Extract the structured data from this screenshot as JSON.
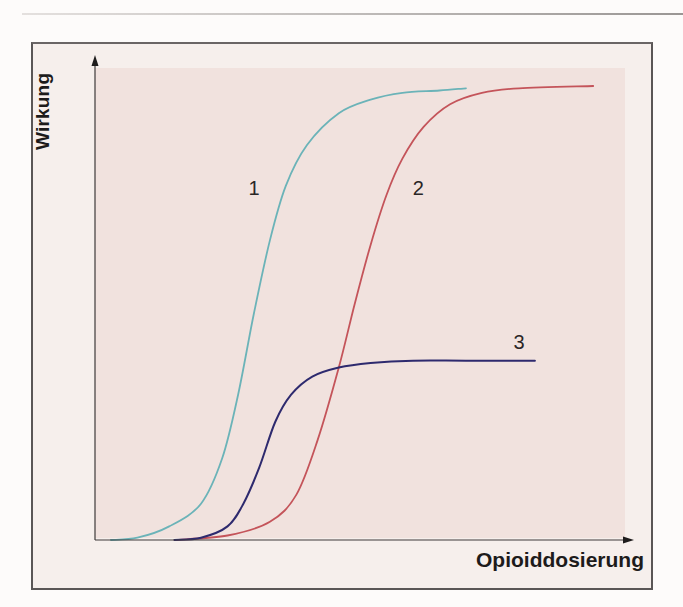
{
  "chart_data": {
    "type": "line",
    "title": "",
    "xlabel": "Opioiddosierung",
    "ylabel": "Wirkung",
    "xlim": [
      0,
      100
    ],
    "ylim": [
      0,
      100
    ],
    "grid": false,
    "legend": "none (inline curve labels)",
    "series": [
      {
        "name": "1",
        "color": "#6bb3b8",
        "x": [
          3,
          8,
          14,
          20,
          24,
          27,
          30,
          33,
          36,
          40,
          46,
          52,
          58,
          65,
          70
        ],
        "y": [
          0,
          0.5,
          3,
          8,
          18,
          32,
          50,
          66,
          78,
          87,
          94,
          97,
          98.5,
          99,
          99.5
        ],
        "label_position": {
          "x": 30,
          "y": 76
        }
      },
      {
        "name": "2",
        "color": "#c4545a",
        "x": [
          15,
          25,
          33,
          38,
          42,
          46,
          49,
          52,
          55,
          58,
          62,
          67,
          73,
          80,
          94
        ],
        "y": [
          0,
          1,
          4,
          10,
          22,
          38,
          52,
          65,
          76,
          84,
          91,
          96,
          98.5,
          99.5,
          100
        ],
        "label_position": {
          "x": 61,
          "y": 76
        }
      },
      {
        "name": "3",
        "color": "#2e2a6e",
        "x": [
          15,
          20,
          25,
          28,
          31,
          34,
          37,
          41,
          46,
          52,
          60,
          70,
          83
        ],
        "y": [
          0,
          0.5,
          3,
          8,
          16,
          26,
          32,
          36,
          38,
          39,
          39.5,
          39.5,
          39.5
        ],
        "label_position": {
          "x": 80,
          "y": 42
        }
      }
    ]
  }
}
